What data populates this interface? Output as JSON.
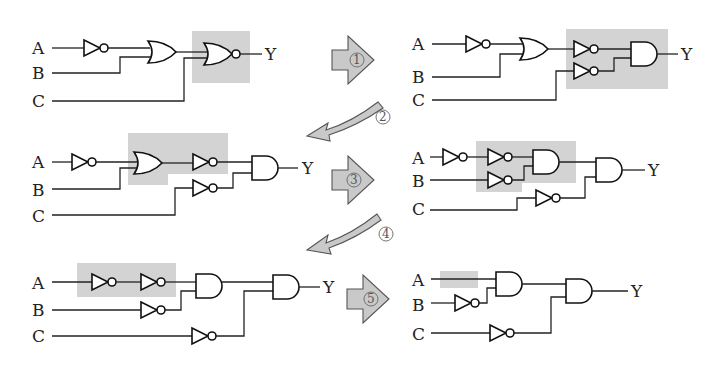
{
  "diagram": {
    "type": "logic-circuit-simplification",
    "labels": {
      "input_a": "A",
      "input_b": "B",
      "input_c": "C",
      "output": "Y"
    },
    "steps": [
      {
        "id": "1",
        "label": "①"
      },
      {
        "id": "2",
        "label": "②"
      },
      {
        "id": "3",
        "label": "③"
      },
      {
        "id": "4",
        "label": "④"
      },
      {
        "id": "5",
        "label": "⑤"
      }
    ],
    "circuits": [
      {
        "name": "circuit-1",
        "gates": [
          "NOT(A)",
          "OR(¬A,B)",
          "NOR(.,C)"
        ],
        "highlight": "NOR gate"
      },
      {
        "name": "circuit-2",
        "gates": [
          "NOT(A)",
          "OR(¬A,B)",
          "NOT",
          "NOT(C)",
          "AND"
        ],
        "highlight": "NOT-NOT-AND block"
      },
      {
        "name": "circuit-3",
        "gates": [
          "NOT(A)",
          "OR(¬A,B)",
          "NOT",
          "NOT(C)",
          "AND"
        ],
        "highlight": "OR + NOT"
      },
      {
        "name": "circuit-4",
        "gates": [
          "NOT(A)",
          "NOT",
          "NOT(B)",
          "AND",
          "NOT(C)",
          "AND"
        ],
        "highlight": "NOT-NOT-AND block"
      },
      {
        "name": "circuit-5",
        "gates": [
          "NOT(A)",
          "NOT",
          "NOT(B)",
          "AND",
          "NOT(C)",
          "AND"
        ],
        "highlight": "double NOT on A"
      },
      {
        "name": "circuit-6",
        "gates": [
          "NOT(B)",
          "AND(A,¬B)",
          "NOT(C)",
          "AND"
        ],
        "highlight": "wire A"
      }
    ]
  }
}
